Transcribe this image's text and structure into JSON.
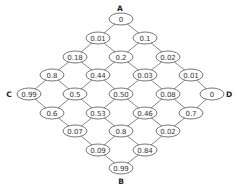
{
  "diagram": {
    "type": "diamond-lattice",
    "labels": {
      "A": {
        "text": "A",
        "x": 120,
        "y": 8
      },
      "B": {
        "text": "B",
        "x": 121,
        "y": 181
      },
      "C": {
        "text": "C",
        "x": 9,
        "y": 94
      },
      "D": {
        "text": "D",
        "x": 229,
        "y": 94
      }
    },
    "node_size": {
      "rx": 12,
      "ry": 6
    },
    "nodes": [
      {
        "id": "r1c1",
        "value": "0",
        "x": 121,
        "y": 19
      },
      {
        "id": "r2c1",
        "value": "0.01",
        "x": 98,
        "y": 38
      },
      {
        "id": "r2c2",
        "value": "0.1",
        "x": 145,
        "y": 38
      },
      {
        "id": "r3c1",
        "value": "0.18",
        "x": 75,
        "y": 57
      },
      {
        "id": "r3c2",
        "value": "0.2",
        "x": 121,
        "y": 57
      },
      {
        "id": "r3c3",
        "value": "0.02",
        "x": 168,
        "y": 57
      },
      {
        "id": "r4c1",
        "value": "0.8",
        "x": 52,
        "y": 75
      },
      {
        "id": "r4c2",
        "value": "0.44",
        "x": 98,
        "y": 75
      },
      {
        "id": "r4c3",
        "value": "0.03",
        "x": 145,
        "y": 75
      },
      {
        "id": "r4c4",
        "value": "0.01",
        "x": 191,
        "y": 75
      },
      {
        "id": "r5c1",
        "value": "0.99",
        "x": 29,
        "y": 94
      },
      {
        "id": "r5c2",
        "value": "0.5",
        "x": 75,
        "y": 94
      },
      {
        "id": "r5c3",
        "value": "0.50",
        "x": 121,
        "y": 94
      },
      {
        "id": "r5c4",
        "value": "0.08",
        "x": 168,
        "y": 94
      },
      {
        "id": "r5c5",
        "value": "0",
        "x": 212,
        "y": 94
      },
      {
        "id": "r6c1",
        "value": "0.6",
        "x": 52,
        "y": 113
      },
      {
        "id": "r6c2",
        "value": "0.53",
        "x": 98,
        "y": 113
      },
      {
        "id": "r6c3",
        "value": "0.46",
        "x": 145,
        "y": 113
      },
      {
        "id": "r6c4",
        "value": "0.7",
        "x": 191,
        "y": 113
      },
      {
        "id": "r7c1",
        "value": "0.07",
        "x": 75,
        "y": 131
      },
      {
        "id": "r7c2",
        "value": "0.8",
        "x": 121,
        "y": 131
      },
      {
        "id": "r7c3",
        "value": "0.02",
        "x": 168,
        "y": 131
      },
      {
        "id": "r8c1",
        "value": "0.09",
        "x": 98,
        "y": 150
      },
      {
        "id": "r8c2",
        "value": "0.84",
        "x": 145,
        "y": 150
      },
      {
        "id": "r9c1",
        "value": "0.99",
        "x": 121,
        "y": 168
      }
    ],
    "edges": [
      [
        "r1c1",
        "r2c1"
      ],
      [
        "r1c1",
        "r2c2"
      ],
      [
        "r2c1",
        "r3c1"
      ],
      [
        "r2c1",
        "r3c2"
      ],
      [
        "r2c2",
        "r3c2"
      ],
      [
        "r2c2",
        "r3c3"
      ],
      [
        "r3c1",
        "r4c1"
      ],
      [
        "r3c1",
        "r4c2"
      ],
      [
        "r3c2",
        "r4c2"
      ],
      [
        "r3c2",
        "r4c3"
      ],
      [
        "r3c3",
        "r4c3"
      ],
      [
        "r3c3",
        "r4c4"
      ],
      [
        "r4c1",
        "r5c1"
      ],
      [
        "r4c1",
        "r5c2"
      ],
      [
        "r4c2",
        "r5c2"
      ],
      [
        "r4c2",
        "r5c3"
      ],
      [
        "r4c3",
        "r5c3"
      ],
      [
        "r4c3",
        "r5c4"
      ],
      [
        "r4c4",
        "r5c4"
      ],
      [
        "r4c4",
        "r5c5"
      ],
      [
        "r5c1",
        "r6c1"
      ],
      [
        "r5c2",
        "r6c1"
      ],
      [
        "r5c2",
        "r6c2"
      ],
      [
        "r5c3",
        "r6c2"
      ],
      [
        "r5c3",
        "r6c3"
      ],
      [
        "r5c4",
        "r6c3"
      ],
      [
        "r5c4",
        "r6c4"
      ],
      [
        "r5c5",
        "r6c4"
      ],
      [
        "r6c1",
        "r7c1"
      ],
      [
        "r6c2",
        "r7c1"
      ],
      [
        "r6c2",
        "r7c2"
      ],
      [
        "r6c3",
        "r7c2"
      ],
      [
        "r6c3",
        "r7c3"
      ],
      [
        "r6c4",
        "r7c3"
      ],
      [
        "r7c1",
        "r8c1"
      ],
      [
        "r7c2",
        "r8c1"
      ],
      [
        "r7c2",
        "r8c2"
      ],
      [
        "r7c3",
        "r8c2"
      ],
      [
        "r8c1",
        "r9c1"
      ],
      [
        "r8c2",
        "r9c1"
      ]
    ]
  }
}
